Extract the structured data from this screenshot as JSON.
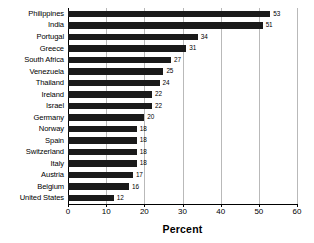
{
  "chart_data": {
    "type": "bar",
    "orientation": "horizontal",
    "title": "",
    "xlabel": "Percent",
    "ylabel": "",
    "xlim": [
      0,
      60
    ],
    "xticks": [
      0,
      10,
      20,
      30,
      40,
      50,
      60
    ],
    "xtick_labels": [
      "0",
      "10",
      "20",
      "30",
      "40",
      "50",
      "60"
    ],
    "grid": true,
    "grid_axis": "x",
    "legend": false,
    "bar_color": "#1a1a1a",
    "value_labels": true,
    "categories": [
      "Philippines",
      "India",
      "Portugal",
      "Greece",
      "South Africa",
      "Venezuela",
      "Thailand",
      "Ireland",
      "Israel",
      "Germany",
      "Norway",
      "Spain",
      "Switzerland",
      "Italy",
      "Austria",
      "Belgium",
      "United States"
    ],
    "values": [
      53,
      51,
      34,
      31,
      27,
      25,
      24,
      22,
      22,
      20,
      18,
      18,
      18,
      18,
      17,
      16,
      12
    ]
  }
}
